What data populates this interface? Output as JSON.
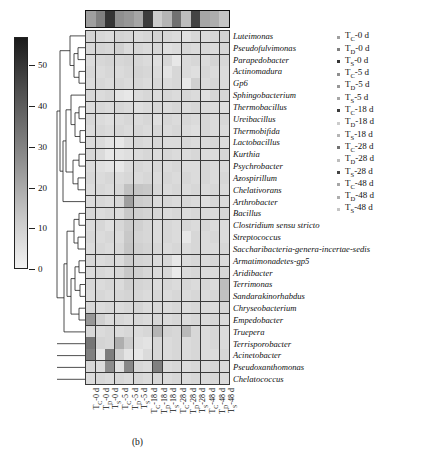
{
  "caption": "(b)",
  "colorbar": {
    "name": "abundance-colorbar",
    "ticks": [
      0,
      10,
      20,
      30,
      40,
      50
    ],
    "min": 0,
    "max": 57,
    "dark_color": "#1a1a1a",
    "light_color": "#f2f2f2"
  },
  "legend": {
    "items": [
      {
        "main": "T",
        "sub": "C",
        "suffix": "-0 d"
      },
      {
        "main": "T",
        "sub": "D",
        "suffix": "-0 d"
      },
      {
        "main": "T",
        "sub": "S",
        "suffix": "-0 d"
      },
      {
        "main": "T",
        "sub": "C",
        "suffix": "-5 d"
      },
      {
        "main": "T",
        "sub": "D",
        "suffix": "-5 d"
      },
      {
        "main": "T",
        "sub": "S",
        "suffix": "-5 d"
      },
      {
        "main": "T",
        "sub": "C",
        "suffix": "-18 d"
      },
      {
        "main": "T",
        "sub": "D",
        "suffix": "-18 d"
      },
      {
        "main": "T",
        "sub": "S",
        "suffix": "-18 d"
      },
      {
        "main": "T",
        "sub": "C",
        "suffix": "-28 d"
      },
      {
        "main": "T",
        "sub": "D",
        "suffix": "-28 d"
      },
      {
        "main": "T",
        "sub": "S",
        "suffix": "-28 d"
      },
      {
        "main": "T",
        "sub": "C",
        "suffix": "-48 d"
      },
      {
        "main": "T",
        "sub": "D",
        "suffix": "-48 d"
      },
      {
        "main": "T",
        "sub": "S",
        "suffix": "-48 d"
      }
    ]
  },
  "chart_data": {
    "type": "heatmap",
    "title": "",
    "xlabel": "",
    "ylabel": "",
    "colorbar_label": "",
    "zlim": [
      0,
      57
    ],
    "grid": true,
    "legend_position": "right",
    "categories_x": [
      "T_C-0 d",
      "T_D-0 d",
      "T_S-0 d",
      "T_C-5 d",
      "T_D-5 d",
      "T_S-5 d",
      "T_C-18 d",
      "T_D-18 d",
      "T_S-18 d",
      "T_C-28 d",
      "T_D-28 d",
      "T_S-28 d",
      "T_C-48 d",
      "T_D-48 d",
      "T_S-48 d"
    ],
    "x_sub": [
      {
        "main": "T",
        "sub": "C",
        "suffix": "-0 d"
      },
      {
        "main": "T",
        "sub": "D",
        "suffix": "-0 d"
      },
      {
        "main": "T",
        "sub": "S",
        "suffix": "-0 d"
      },
      {
        "main": "T",
        "sub": "C",
        "suffix": "-5 d"
      },
      {
        "main": "T",
        "sub": "D",
        "suffix": "-5 d"
      },
      {
        "main": "T",
        "sub": "S",
        "suffix": "-5 d"
      },
      {
        "main": "T",
        "sub": "C",
        "suffix": "-18 d"
      },
      {
        "main": "T",
        "sub": "D",
        "suffix": "-18 d"
      },
      {
        "main": "T",
        "sub": "S",
        "suffix": "-18 d"
      },
      {
        "main": "T",
        "sub": "C",
        "suffix": "-28 d"
      },
      {
        "main": "T",
        "sub": "D",
        "suffix": "-28 d"
      },
      {
        "main": "T",
        "sub": "S",
        "suffix": "-28 d"
      },
      {
        "main": "T",
        "sub": "C",
        "suffix": "-48 d"
      },
      {
        "main": "T",
        "sub": "D",
        "suffix": "-48 d"
      },
      {
        "main": "T",
        "sub": "S",
        "suffix": "-48 d"
      }
    ],
    "categories_y": [
      "Luteimonas",
      "Pseudofulvimonas",
      "Parapedobacter",
      "Actinomadura",
      "Gp6",
      "Sphingobacterium",
      "Thermobacillus",
      "Ureibacillus",
      "Thermobifida",
      "Lactobacillus",
      "Kurthia",
      "Psychrobacter",
      "Azospirillum",
      "Chelativorans",
      "Arthrobacter",
      "Bacillus",
      "Clostridium sensu stricto",
      "Streptococcus",
      "Saccharibacteria-genera-incertae-sedis",
      "Armatimonadetes-gp5",
      "Aridibacter",
      "Terrimonas",
      "Sandarakinorhabdus",
      "Chryseobacterium",
      "Empedobacter",
      "Truepera",
      "Terrisporobacter",
      "Acinetobacter",
      "Pseudoxanthomonas",
      "Chelatococcus"
    ],
    "top_strip_values": [
      22,
      30,
      50,
      26,
      24,
      20,
      48,
      10,
      16,
      34,
      14,
      46,
      20,
      18,
      12
    ],
    "values": [
      [
        8,
        7,
        6,
        8,
        7,
        6,
        7,
        8,
        7,
        6,
        5,
        7,
        6,
        7,
        8
      ],
      [
        7,
        8,
        7,
        9,
        6,
        7,
        6,
        7,
        5,
        6,
        7,
        6,
        7,
        6,
        7
      ],
      [
        6,
        7,
        8,
        7,
        8,
        7,
        6,
        5,
        7,
        3,
        6,
        7,
        6,
        8,
        7
      ],
      [
        7,
        6,
        7,
        6,
        7,
        8,
        7,
        6,
        4,
        7,
        6,
        5,
        7,
        6,
        6
      ],
      [
        6,
        7,
        6,
        7,
        6,
        7,
        6,
        7,
        6,
        7,
        3,
        9,
        6,
        7,
        6
      ],
      [
        7,
        6,
        7,
        4,
        3,
        6,
        7,
        6,
        7,
        6,
        7,
        6,
        5,
        7,
        7
      ],
      [
        6,
        7,
        6,
        7,
        6,
        5,
        6,
        7,
        6,
        7,
        6,
        7,
        6,
        6,
        5
      ],
      [
        7,
        6,
        5,
        6,
        7,
        6,
        7,
        5,
        7,
        6,
        7,
        6,
        7,
        6,
        7
      ],
      [
        6,
        7,
        6,
        7,
        6,
        7,
        6,
        7,
        6,
        7,
        6,
        5,
        7,
        6,
        6
      ],
      [
        6,
        6,
        4,
        3,
        6,
        7,
        6,
        7,
        6,
        6,
        7,
        6,
        6,
        7,
        6
      ],
      [
        7,
        6,
        3,
        4,
        5,
        6,
        7,
        6,
        7,
        6,
        6,
        7,
        6,
        6,
        7
      ],
      [
        6,
        5,
        4,
        3,
        6,
        7,
        6,
        7,
        6,
        7,
        6,
        6,
        7,
        6,
        6
      ],
      [
        7,
        6,
        7,
        6,
        7,
        6,
        7,
        6,
        7,
        6,
        7,
        6,
        7,
        6,
        7
      ],
      [
        6,
        7,
        6,
        7,
        13,
        12,
        11,
        7,
        6,
        7,
        6,
        7,
        6,
        7,
        6
      ],
      [
        6,
        7,
        6,
        7,
        22,
        10,
        9,
        6,
        7,
        6,
        7,
        6,
        5,
        7,
        6
      ],
      [
        7,
        6,
        7,
        6,
        11,
        9,
        8,
        7,
        6,
        7,
        6,
        7,
        6,
        6,
        7
      ],
      [
        6,
        7,
        5,
        7,
        10,
        9,
        7,
        6,
        7,
        6,
        7,
        6,
        7,
        6,
        6
      ],
      [
        7,
        6,
        7,
        6,
        11,
        8,
        7,
        6,
        7,
        6,
        3,
        7,
        6,
        7,
        6
      ],
      [
        6,
        7,
        6,
        7,
        12,
        9,
        8,
        7,
        6,
        7,
        6,
        7,
        6,
        6,
        7
      ],
      [
        7,
        6,
        7,
        6,
        10,
        8,
        7,
        6,
        7,
        3,
        6,
        7,
        6,
        7,
        6
      ],
      [
        6,
        7,
        6,
        7,
        11,
        9,
        7,
        6,
        7,
        2,
        6,
        7,
        6,
        6,
        7
      ],
      [
        7,
        6,
        7,
        6,
        9,
        8,
        7,
        6,
        7,
        6,
        7,
        6,
        7,
        6,
        14
      ],
      [
        6,
        7,
        6,
        7,
        8,
        7,
        6,
        7,
        6,
        7,
        6,
        7,
        6,
        7,
        13
      ],
      [
        7,
        6,
        7,
        6,
        7,
        8,
        6,
        7,
        6,
        7,
        6,
        7,
        6,
        6,
        7
      ],
      [
        24,
        9,
        6,
        7,
        6,
        7,
        6,
        7,
        6,
        7,
        6,
        7,
        6,
        7,
        6
      ],
      [
        7,
        6,
        7,
        6,
        7,
        6,
        7,
        16,
        8,
        7,
        15,
        7,
        6,
        7,
        6
      ],
      [
        33,
        8,
        7,
        18,
        10,
        5,
        4,
        7,
        6,
        7,
        6,
        7,
        6,
        7,
        6
      ],
      [
        30,
        3,
        31,
        9,
        4,
        3,
        6,
        7,
        6,
        7,
        6,
        7,
        6,
        6,
        7
      ],
      [
        7,
        6,
        27,
        5,
        28,
        7,
        6,
        30,
        6,
        7,
        6,
        7,
        6,
        7,
        6
      ],
      [
        6,
        7,
        6,
        7,
        6,
        7,
        6,
        7,
        6,
        7,
        6,
        7,
        6,
        7,
        6
      ]
    ]
  }
}
